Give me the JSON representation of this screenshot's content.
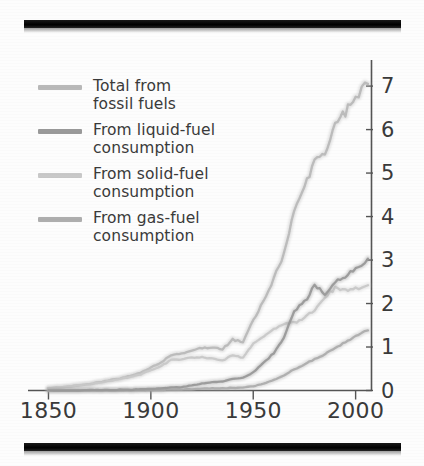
{
  "figure": {
    "top_rule": "black-printing-bar",
    "bottom_rule": "black-printing-bar"
  },
  "legend": {
    "items": [
      {
        "label": "Total from\nfossil fuels",
        "key": "total",
        "color": "#b9b9b9"
      },
      {
        "label": "From liquid-fuel\nconsumption",
        "key": "liquid",
        "color": "#9a9a9a"
      },
      {
        "label": "From solid-fuel\nconsumption",
        "key": "solid",
        "color": "#c9c9c9"
      },
      {
        "label": "From gas-fuel\nconsumption",
        "key": "gas",
        "color": "#aeaeae"
      }
    ]
  },
  "chart_data": {
    "type": "line",
    "title": "",
    "xlabel": "",
    "ylabel": "",
    "xlim": [
      1840,
      2008
    ],
    "ylim": [
      0,
      7.6
    ],
    "xticks": [
      1850,
      1900,
      1950,
      2000
    ],
    "yticks": [
      0,
      1,
      2,
      3,
      4,
      5,
      6,
      7
    ],
    "xtick_labels": [
      "1850",
      "1900",
      "1950",
      "2000"
    ],
    "ytick_labels": [
      "0",
      "1",
      "2",
      "3",
      "4",
      "5",
      "6",
      "7"
    ],
    "grid": false,
    "legend_position": "upper-left",
    "y_axis_side": "right",
    "x": [
      1850,
      1855,
      1860,
      1865,
      1870,
      1875,
      1880,
      1885,
      1890,
      1895,
      1900,
      1905,
      1910,
      1915,
      1920,
      1925,
      1930,
      1935,
      1940,
      1945,
      1950,
      1955,
      1960,
      1965,
      1970,
      1975,
      1980,
      1985,
      1990,
      1995,
      2000,
      2006
    ],
    "series": [
      {
        "name": "Total from fossil fuels",
        "color": "#b9b9b9",
        "values": [
          0.05,
          0.07,
          0.09,
          0.12,
          0.15,
          0.19,
          0.24,
          0.28,
          0.34,
          0.41,
          0.53,
          0.64,
          0.82,
          0.85,
          0.93,
          0.98,
          0.99,
          0.95,
          1.17,
          1.12,
          1.63,
          2.04,
          2.58,
          3.13,
          4.09,
          4.62,
          5.32,
          5.43,
          6.14,
          6.4,
          6.77,
          7.05
        ]
      },
      {
        "name": "From liquid-fuel consumption",
        "color": "#9a9a9a",
        "values": [
          0.0,
          0.0,
          0.0,
          0.0,
          0.01,
          0.01,
          0.01,
          0.02,
          0.02,
          0.03,
          0.04,
          0.05,
          0.07,
          0.08,
          0.12,
          0.16,
          0.19,
          0.21,
          0.27,
          0.29,
          0.42,
          0.63,
          0.86,
          1.2,
          1.84,
          2.03,
          2.42,
          2.21,
          2.49,
          2.62,
          2.8,
          3.03
        ]
      },
      {
        "name": "From solid-fuel consumption",
        "color": "#c9c9c9",
        "values": [
          0.05,
          0.07,
          0.09,
          0.12,
          0.14,
          0.18,
          0.22,
          0.26,
          0.31,
          0.37,
          0.47,
          0.56,
          0.7,
          0.72,
          0.76,
          0.76,
          0.73,
          0.68,
          0.82,
          0.75,
          1.07,
          1.23,
          1.41,
          1.52,
          1.56,
          1.66,
          1.87,
          2.14,
          2.36,
          2.29,
          2.34,
          2.42
        ]
      },
      {
        "name": "From gas-fuel consumption",
        "color": "#aeaeae",
        "values": [
          0.0,
          0.0,
          0.0,
          0.0,
          0.0,
          0.0,
          0.0,
          0.0,
          0.0,
          0.01,
          0.01,
          0.01,
          0.02,
          0.02,
          0.03,
          0.04,
          0.05,
          0.05,
          0.06,
          0.07,
          0.1,
          0.16,
          0.24,
          0.35,
          0.49,
          0.59,
          0.73,
          0.83,
          0.99,
          1.11,
          1.25,
          1.38
        ]
      }
    ]
  }
}
